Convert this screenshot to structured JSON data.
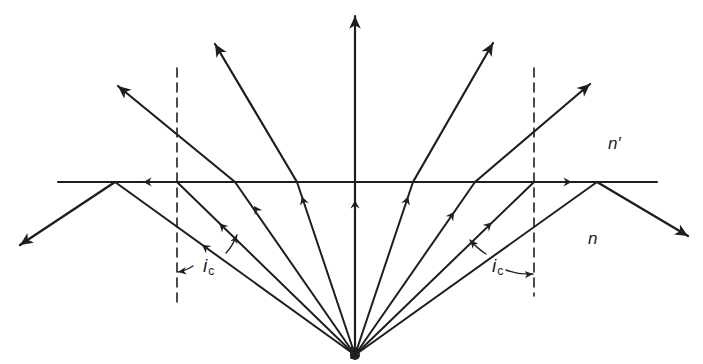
{
  "diagram": {
    "labels": {
      "upper_medium": "n′",
      "lower_medium": "n",
      "critical_angle_symbol": "i",
      "critical_angle_subscript": "c",
      "source_point": "B"
    },
    "colors": {
      "stroke": "#1e1e1e",
      "background": "#ffffff"
    },
    "geometry": {
      "interface_y": 182,
      "interface_x": [
        58,
        657
      ],
      "source": [
        355,
        355
      ],
      "dashed_left_x": 177,
      "dashed_right_x": 534,
      "dashed_y": [
        68,
        308
      ]
    },
    "rays": [
      {
        "id": "reflected-left",
        "hit": [
          115,
          182
        ],
        "out": [
          20,
          245
        ],
        "type": "reflected"
      },
      {
        "id": "critical-left",
        "hit": [
          177,
          182
        ],
        "out": [
          58,
          182
        ],
        "type": "grazing"
      },
      {
        "id": "refracted-left-2",
        "hit": [
          235,
          182
        ],
        "out": [
          118,
          86
        ],
        "type": "refracted"
      },
      {
        "id": "refracted-left-1",
        "hit": [
          297,
          182
        ],
        "out": [
          215,
          44
        ],
        "type": "refracted"
      },
      {
        "id": "normal",
        "hit": [
          355,
          182
        ],
        "out": [
          355,
          15
        ],
        "type": "refracted"
      },
      {
        "id": "refracted-right-1",
        "hit": [
          413,
          182
        ],
        "out": [
          493,
          43
        ],
        "type": "refracted"
      },
      {
        "id": "refracted-right-2",
        "hit": [
          475,
          182
        ],
        "out": [
          590,
          84
        ],
        "type": "refracted"
      },
      {
        "id": "critical-right",
        "hit": [
          534,
          182
        ],
        "out": [
          657,
          182
        ],
        "type": "grazing"
      },
      {
        "id": "reflected-right",
        "hit": [
          597,
          182
        ],
        "out": [
          688,
          236
        ],
        "type": "reflected"
      }
    ]
  }
}
